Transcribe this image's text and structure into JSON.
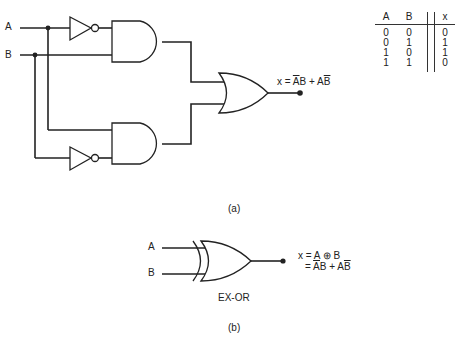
{
  "figure_a": {
    "inputs": [
      "A",
      "B"
    ],
    "output_expression": {
      "prefix": "x = ",
      "t1_bar": "A",
      "t1_rest": "B",
      "plus": " + ",
      "t2_rest": "A",
      "t2_bar": "B"
    },
    "caption": "(a)",
    "gates": [
      "NOT",
      "AND",
      "NOT",
      "AND",
      "OR"
    ]
  },
  "truth_table": {
    "headers": [
      "A",
      "B",
      "x"
    ],
    "rows": [
      [
        "0",
        "0",
        "0"
      ],
      [
        "0",
        "1",
        "1"
      ],
      [
        "1",
        "0",
        "1"
      ],
      [
        "1",
        "1",
        "0"
      ]
    ]
  },
  "figure_b": {
    "inputs": [
      "A",
      "B"
    ],
    "gate_label": "EX-OR",
    "expr_line1": {
      "prefix": "x = ",
      "a": "A",
      "op": " ⊕ ",
      "b": "B"
    },
    "expr_line2": {
      "prefix": "= ",
      "t1_bar": "A",
      "t1_rest": "B",
      "plus": " + ",
      "t2_rest": "A",
      "t2_bar": "B"
    },
    "caption": "(b)"
  }
}
